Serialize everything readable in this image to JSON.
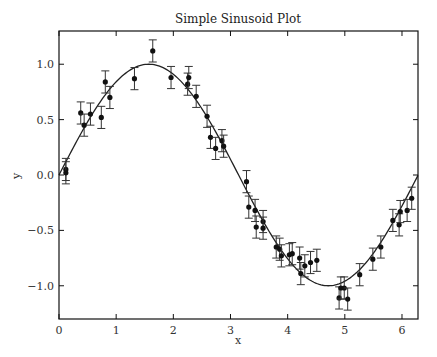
{
  "chart_data": {
    "type": "scatter",
    "title": "Simple Sinusoid Plot",
    "xlabel": "x",
    "ylabel": "y",
    "xlim": [
      0,
      6.28
    ],
    "ylim": [
      -1.3,
      1.3
    ],
    "xticks": [
      0,
      1,
      2,
      3,
      4,
      5,
      6
    ],
    "yticks": [
      -1.0,
      -0.5,
      0.0,
      0.5,
      1.0
    ],
    "xtick_labels": [
      "0",
      "1",
      "2",
      "3",
      "4",
      "5",
      "6"
    ],
    "ytick_labels": [
      "−1.0",
      "−0.5",
      "0.0",
      "0.5",
      "1.0"
    ],
    "grid": false,
    "legend": null,
    "series": [
      {
        "name": "sin(x)",
        "kind": "line",
        "function": "sin",
        "x_range": [
          0,
          6.28
        ]
      },
      {
        "name": "noisy samples",
        "kind": "errorbar",
        "yerr": 0.1,
        "points": [
          [
            0.12,
            0.05
          ],
          [
            0.12,
            0.02
          ],
          [
            0.38,
            0.56
          ],
          [
            0.44,
            0.45
          ],
          [
            0.55,
            0.55
          ],
          [
            0.74,
            0.52
          ],
          [
            0.81,
            0.84
          ],
          [
            0.89,
            0.7
          ],
          [
            1.32,
            0.87
          ],
          [
            1.64,
            1.12
          ],
          [
            1.96,
            0.88
          ],
          [
            2.25,
            0.82
          ],
          [
            2.27,
            0.88
          ],
          [
            2.4,
            0.71
          ],
          [
            2.59,
            0.53
          ],
          [
            2.65,
            0.34
          ],
          [
            2.74,
            0.24
          ],
          [
            2.85,
            0.31
          ],
          [
            2.88,
            0.26
          ],
          [
            3.28,
            -0.06
          ],
          [
            3.32,
            -0.29
          ],
          [
            3.43,
            -0.32
          ],
          [
            3.45,
            -0.47
          ],
          [
            3.57,
            -0.42
          ],
          [
            3.57,
            -0.48
          ],
          [
            3.8,
            -0.65
          ],
          [
            3.86,
            -0.67
          ],
          [
            3.89,
            -0.73
          ],
          [
            4.03,
            -0.72
          ],
          [
            4.08,
            -0.71
          ],
          [
            4.21,
            -0.75
          ],
          [
            4.23,
            -0.89
          ],
          [
            4.3,
            -0.82
          ],
          [
            4.4,
            -0.79
          ],
          [
            4.51,
            -0.77
          ],
          [
            4.9,
            -1.11
          ],
          [
            4.93,
            -1.02
          ],
          [
            4.99,
            -1.02
          ],
          [
            5.05,
            -1.12
          ],
          [
            5.26,
            -0.9
          ],
          [
            5.49,
            -0.76
          ],
          [
            5.63,
            -0.65
          ],
          [
            5.84,
            -0.41
          ],
          [
            5.95,
            -0.45
          ],
          [
            5.97,
            -0.33
          ],
          [
            6.09,
            -0.32
          ],
          [
            6.17,
            -0.21
          ]
        ]
      }
    ]
  },
  "colors": {
    "line": "#222222",
    "points": "#111111",
    "errorbar": "#333333",
    "axes": "#111111"
  }
}
